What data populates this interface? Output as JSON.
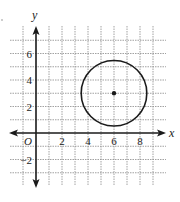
{
  "figure": {
    "type": "coordinate-plane",
    "axes": {
      "x_label": "x",
      "y_label": "y",
      "origin_label": "O",
      "x_ticks": [
        {
          "value": 2,
          "label": "2"
        },
        {
          "value": 4,
          "label": "4"
        },
        {
          "value": 6,
          "label": "6"
        },
        {
          "value": 8,
          "label": "8"
        }
      ],
      "y_ticks": [
        {
          "value": 2,
          "label": "2"
        },
        {
          "value": 4,
          "label": "4"
        },
        {
          "value": 6,
          "label": "6"
        },
        {
          "value": -2,
          "label": "−2"
        }
      ],
      "x_grid_range": [
        -1,
        9
      ],
      "y_grid_range": [
        -3,
        7
      ]
    },
    "circle": {
      "center": [
        6,
        3
      ],
      "radius": 2.5,
      "center_marked": true
    },
    "colors": {
      "grid": "#8a8a8a",
      "axis": "#1a1a1a",
      "circle": "#1a1a1a"
    }
  }
}
